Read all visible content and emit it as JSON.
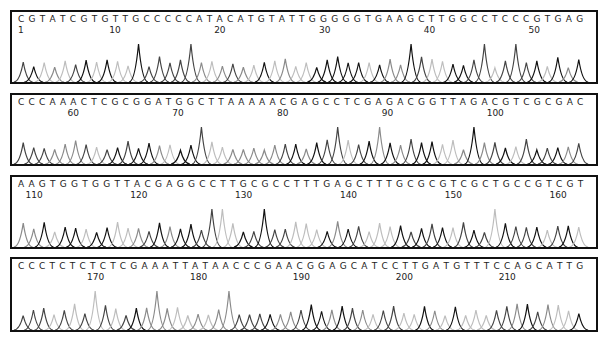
{
  "chart_data": {
    "type": "line",
    "title": "",
    "xlabel": "",
    "ylabel": "",
    "grid": false,
    "legend": null,
    "trace_colors": {
      "A": "#8a8a8a",
      "C": "#444444",
      "G": "#111111",
      "T": "#bdbdbd"
    },
    "rows": [
      {
        "sequence": "CGTATCGTGTTGCCCCCATACATGTATTGGGGGTGAAGCTTGGCCTCCCGTGAG",
        "start": 1,
        "tick_labels": [
          "1",
          "10",
          "20",
          "30",
          "40",
          "50"
        ]
      },
      {
        "sequence": "CCCAAACTCGCGGATGGCTTAAAAACGAGCCTCGAGACGGTTAGACGTCGCGAC",
        "start": 55,
        "tick_labels": [
          "60",
          "70",
          "80",
          "90",
          "100"
        ]
      },
      {
        "sequence": "AAGTGGTGGTTACGAGGCCTTGCGCCTTTGAGCTTTGCGCGTCGCTGCCGTCGT",
        "start": 109,
        "tick_labels": [
          "110",
          "120",
          "130",
          "140",
          "150",
          "160"
        ]
      },
      {
        "sequence": "CCCTCTCTCTCGAAATTATAACCCGAACGGAGCATCCTTGATGTTTCCAGCATTG",
        "start": 163,
        "tick_labels": [
          "170",
          "180",
          "190",
          "200",
          "210"
        ]
      }
    ]
  }
}
